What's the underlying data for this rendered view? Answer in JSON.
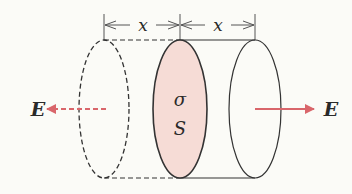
{
  "diagram": {
    "type": "gaussian-cylinder-charged-sheet",
    "labels": {
      "distance_left": "x",
      "distance_right": "x",
      "surface_charge_density": "σ",
      "area": "S",
      "field_left": "E",
      "field_right": "E"
    },
    "colors": {
      "sheet_fill": "#f6dcd6",
      "outline": "#333333",
      "field_arrow": "#d9666b",
      "background": "#fbfbf7"
    },
    "elements": {
      "left_end_cap": {
        "style": "dashed"
      },
      "charged_sheet": {
        "style": "solid-filled"
      },
      "right_end_cap": {
        "style": "solid"
      },
      "left_field_arrow": {
        "style": "dashed",
        "direction": "left"
      },
      "right_field_arrow": {
        "style": "solid",
        "direction": "right"
      }
    }
  }
}
